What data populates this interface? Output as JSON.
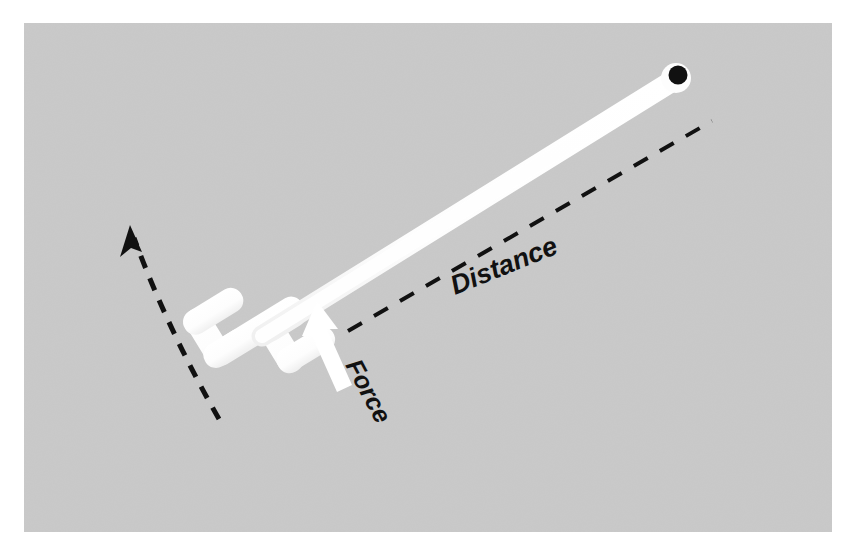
{
  "figure": {
    "type": "physics-diagram",
    "canvas": {
      "width": 853,
      "height": 552
    },
    "background": {
      "page_color": "#ffffff",
      "panel_color": "#c9c9c9",
      "panel_rect": {
        "x": 24,
        "y": 23,
        "width": 808,
        "height": 509
      }
    },
    "labels": [
      {
        "name": "distance-label",
        "text": "Distance",
        "color": "#111111",
        "font_size": 27,
        "rotation_deg": -22,
        "x": 455,
        "y": 295
      },
      {
        "name": "force-label",
        "text": "Force",
        "color": "#111111",
        "font_size": 25,
        "rotation_deg": 62,
        "x": 345,
        "y": 365
      }
    ],
    "wrench": {
      "name": "wrench",
      "color": "#fdfdfd",
      "shaft": {
        "from": {
          "x": 270,
          "y": 330
        },
        "to": {
          "x": 674,
          "y": 80
        },
        "thickness": 20
      },
      "hole": {
        "name": "wrench-hole",
        "center": {
          "x": 678,
          "y": 75
        },
        "radius": 9,
        "color": "#111111"
      },
      "head": {
        "description": "double open-ended jaw head",
        "center": {
          "x": 250,
          "y": 335
        }
      }
    },
    "force_arrow": {
      "name": "force-arrow",
      "color": "#ffffff",
      "tail": {
        "x": 349,
        "y": 381
      },
      "tip": {
        "x": 317,
        "y": 303
      },
      "shaft_width": 15,
      "head_width": 34,
      "head_length": 30
    },
    "distance_line": {
      "name": "distance-dashed-line",
      "color": "#111111",
      "from": {
        "x": 348,
        "y": 331
      },
      "to": {
        "x": 712,
        "y": 121
      },
      "stroke_width": 4,
      "dash_pattern": "16 14"
    },
    "rotation_arrow": {
      "name": "rotation-dashed-arrow",
      "color": "#111111",
      "from": {
        "x": 219,
        "y": 419
      },
      "to": {
        "x": 131,
        "y": 231
      },
      "stroke_width": 5,
      "dash_pattern": "13 11",
      "curved": true,
      "arrowhead": "at-top"
    }
  }
}
